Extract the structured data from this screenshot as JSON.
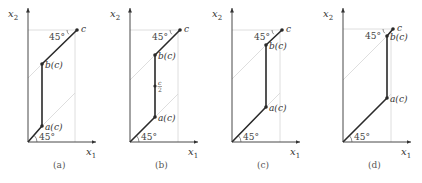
{
  "figure": {
    "axis_labels": {
      "x": "x1",
      "y": "x2",
      "x_main": "x",
      "x_sub": "1",
      "y_main": "x",
      "y_sub": "2"
    },
    "angle_label": "45°",
    "colors": {
      "path": "#2a2a2a",
      "guide": "#d6d6d6",
      "axis": "#333333",
      "text": "#333333"
    },
    "panels": [
      {
        "caption": "(a)",
        "origin": [
          28,
          142
        ],
        "a": [
          42,
          126
        ],
        "b": [
          42,
          64
        ],
        "c": [
          77,
          30
        ],
        "a_label": "a(c)",
        "b_label": "b(c)",
        "c_label": "c",
        "mid": null
      },
      {
        "caption": "(b)",
        "origin": [
          130,
          142
        ],
        "a": [
          155,
          117
        ],
        "b": [
          155,
          55
        ],
        "c": [
          180,
          30
        ],
        "a_label": "a(c)",
        "b_label": "b(c)",
        "c_label": "c",
        "mid": {
          "point": [
            155,
            86
          ],
          "label_num": "c",
          "label_den": "2"
        }
      },
      {
        "caption": "(c)",
        "origin": [
          232,
          142
        ],
        "a": [
          266,
          107
        ],
        "b": [
          266,
          45
        ],
        "c": [
          282,
          30
        ],
        "a_label": "a(c)",
        "b_label": "b(c)",
        "c_label": "c",
        "mid": null
      },
      {
        "caption": "(d)",
        "origin": [
          343,
          142
        ],
        "a": [
          387,
          98
        ],
        "b": [
          387,
          36
        ],
        "c": [
          393,
          29
        ],
        "a_label": "a(c)",
        "b_label": "b(c)",
        "c_label": "c",
        "mid": null
      }
    ]
  }
}
